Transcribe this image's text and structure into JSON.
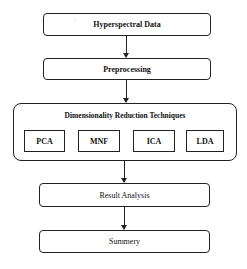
{
  "diagram": {
    "type": "flowchart",
    "steps": [
      {
        "label": "Hyperspectral Data"
      },
      {
        "label": "Preprocessing"
      },
      {
        "label": "Dimensionality Reduction Techniques",
        "techniques": [
          "PCA",
          "MNF",
          "ICA",
          "LDA"
        ]
      },
      {
        "label": "Result Analysis"
      },
      {
        "label": "Summery"
      }
    ],
    "stray_mark": "’"
  }
}
